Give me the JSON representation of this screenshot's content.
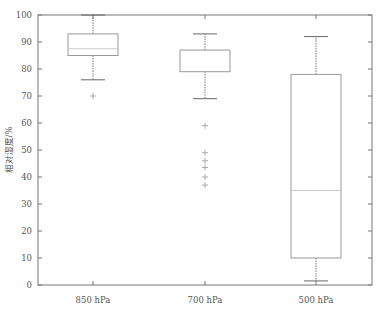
{
  "chart_data": {
    "type": "box",
    "title": "",
    "xlabel": "",
    "ylabel": "相对湿度/%",
    "ylim": [
      0,
      100
    ],
    "yticks": [
      0,
      10,
      20,
      30,
      40,
      50,
      60,
      70,
      80,
      90,
      100
    ],
    "categories": [
      "850 hPa",
      "700 hPa",
      "500 hPa"
    ],
    "boxes": [
      {
        "category": "850 hPa",
        "whisker_low": 76,
        "q1": 85,
        "median": 87.5,
        "q3": 93,
        "whisker_high": 100,
        "outliers": [
          70
        ]
      },
      {
        "category": "700 hPa",
        "whisker_low": 69,
        "q1": 79,
        "median": 87,
        "q3": 87,
        "whisker_high": 93,
        "outliers": [
          59,
          49,
          46,
          43.5,
          40,
          37
        ]
      },
      {
        "category": "500 hPa",
        "whisker_low": 1.5,
        "q1": 10,
        "median": 35,
        "q3": 78,
        "whisker_high": 92,
        "outliers": []
      }
    ],
    "grid": false,
    "legend": null
  },
  "colors": {
    "axis": "#777777",
    "box": "#999999",
    "median": "#c8c8c8",
    "outlier": "#aaaaaa"
  }
}
